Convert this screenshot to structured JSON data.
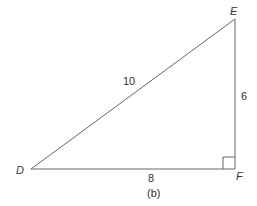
{
  "diagram": {
    "type": "right-triangle",
    "vertices": {
      "D": {
        "label": "D"
      },
      "E": {
        "label": "E"
      },
      "F": {
        "label": "F"
      }
    },
    "sides": {
      "DE": "10",
      "EF": "6",
      "DF": "8"
    },
    "right_angle_at": "F",
    "caption": "(b)",
    "stroke_color": "#555555"
  }
}
